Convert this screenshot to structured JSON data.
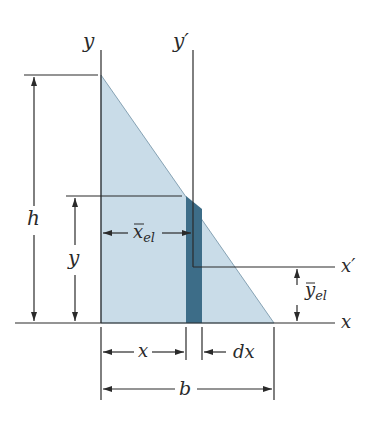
{
  "figure": {
    "type": "centroid-of-triangle-diagram",
    "colors": {
      "triangle_fill": "#c9dce8",
      "strip_fill": "#3d6d88",
      "strip_edge": "#2e5a72",
      "line": "#2a2a2a",
      "background": "#ffffff"
    },
    "labels": {
      "y_axis": "y",
      "y_prime_axis": "y′",
      "x_axis": "x",
      "x_prime_axis": "x′",
      "height": "h",
      "strip_height": "y",
      "x_el_bar": "x",
      "x_el_sub": "el",
      "y_el_bar": "y",
      "y_el_sub": "el",
      "x_distance": "x",
      "dx": "dx",
      "base": "b"
    }
  }
}
